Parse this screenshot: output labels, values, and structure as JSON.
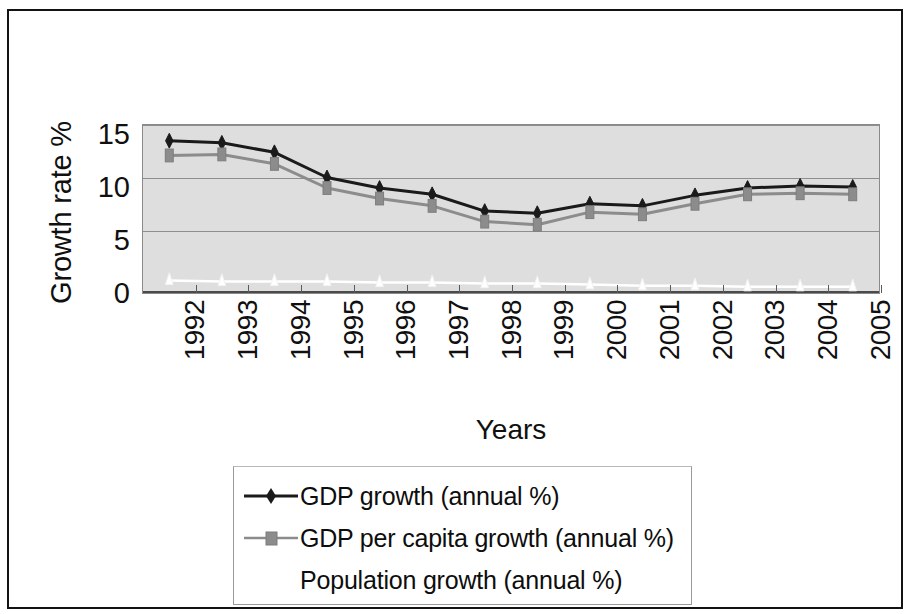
{
  "chart_data": {
    "type": "line",
    "title": "",
    "xlabel": "Years",
    "ylabel": "Growth rate %",
    "categories": [
      "1992",
      "1993",
      "1994",
      "1995",
      "1996",
      "1997",
      "1998",
      "1999",
      "2000",
      "2001",
      "2002",
      "2003",
      "2004",
      "2005"
    ],
    "ylim": [
      0,
      16
    ],
    "yticks": [
      0,
      5,
      10,
      15
    ],
    "grid": true,
    "legend_position": "bottom",
    "series": [
      {
        "name": "GDP growth (annual %)",
        "color": "#1a1a1a",
        "marker": "diamond",
        "values": [
          14.5,
          14.3,
          13.4,
          11.0,
          10.0,
          9.4,
          7.8,
          7.6,
          8.5,
          8.3,
          9.3,
          10.0,
          10.2,
          10.1
        ]
      },
      {
        "name": "GDP per capita growth (annual %)",
        "color": "#8c8c8c",
        "marker": "square",
        "values": [
          13.1,
          13.2,
          12.3,
          10.0,
          9.0,
          8.3,
          6.8,
          6.5,
          7.7,
          7.5,
          8.5,
          9.4,
          9.5,
          9.4
        ]
      },
      {
        "name": "Population growth (annual %)",
        "color": "#ffffff",
        "marker": "triangle",
        "values": [
          1.2,
          1.1,
          1.1,
          1.1,
          1.0,
          1.0,
          0.9,
          0.9,
          0.8,
          0.7,
          0.7,
          0.6,
          0.6,
          0.6
        ]
      }
    ]
  },
  "axes": {
    "y_title": "Growth rate %",
    "x_title": "Years",
    "y_tick_labels": [
      "15",
      "10",
      "5",
      "0"
    ],
    "x_tick_labels": [
      "1992",
      "1993",
      "1994",
      "1995",
      "1996",
      "1997",
      "1998",
      "1999",
      "2000",
      "2001",
      "2002",
      "2003",
      "2004",
      "2005"
    ]
  },
  "legend": {
    "entries": [
      {
        "label": "GDP growth (annual %)",
        "marker": "diamond-marker",
        "color": "#1a1a1a"
      },
      {
        "label": "GDP per capita growth (annual %)",
        "marker": "square-marker",
        "color": "#8c8c8c"
      },
      {
        "label": "Population growth (annual %)",
        "marker": "triangle-marker",
        "color": "#ffffff"
      }
    ]
  },
  "colors": {
    "plot_background": "#dedede",
    "gridline": "#8e8e8e",
    "frame": "#131313",
    "gdp": "#1a1a1a",
    "gdp_per_capita": "#8c8c8c",
    "population": "#ffffff"
  }
}
